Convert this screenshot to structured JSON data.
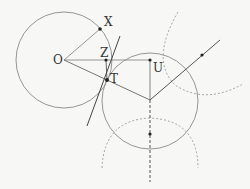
{
  "diagram": {
    "colors": {
      "line": "#8a8a8a",
      "dark": "#333333",
      "dashed": "#9a9a9a",
      "background": "#f7f7f5"
    },
    "points": {
      "O": {
        "label": "O",
        "x": 64,
        "y": 60
      },
      "X": {
        "label": "X",
        "x": 100,
        "y": 29
      },
      "Z": {
        "label": "Z",
        "x": 106,
        "y": 60
      },
      "T": {
        "label": "T",
        "x": 107,
        "y": 80
      },
      "U": {
        "label": "U",
        "x": 150,
        "y": 60
      }
    },
    "labels": {
      "O": "O",
      "X": "X",
      "Z": "Z",
      "T": "T",
      "U": "U"
    }
  }
}
